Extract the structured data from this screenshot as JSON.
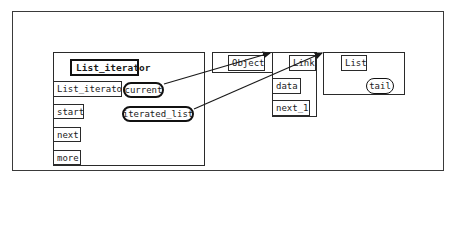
{
  "diagram": {
    "classes": {
      "list_iterator": {
        "title": "List_iterator",
        "features": {
          "constructor": "List_iterator",
          "start": "start",
          "next": "next",
          "more": "more"
        },
        "attributes": {
          "current": "current",
          "iterated_list": "iterated_list"
        }
      },
      "object": {
        "title": "Object"
      },
      "link": {
        "title": "Link",
        "features": {
          "data": "data",
          "next_1": "next_1"
        }
      },
      "list": {
        "title": "List",
        "attributes": {
          "tail": "tail"
        }
      }
    },
    "relations": [
      {
        "from": "current",
        "to": "Object"
      },
      {
        "from": "iterated_list",
        "to": "List"
      }
    ],
    "colors": {
      "line": "#1a1a1a",
      "background": "#ffffff"
    }
  }
}
